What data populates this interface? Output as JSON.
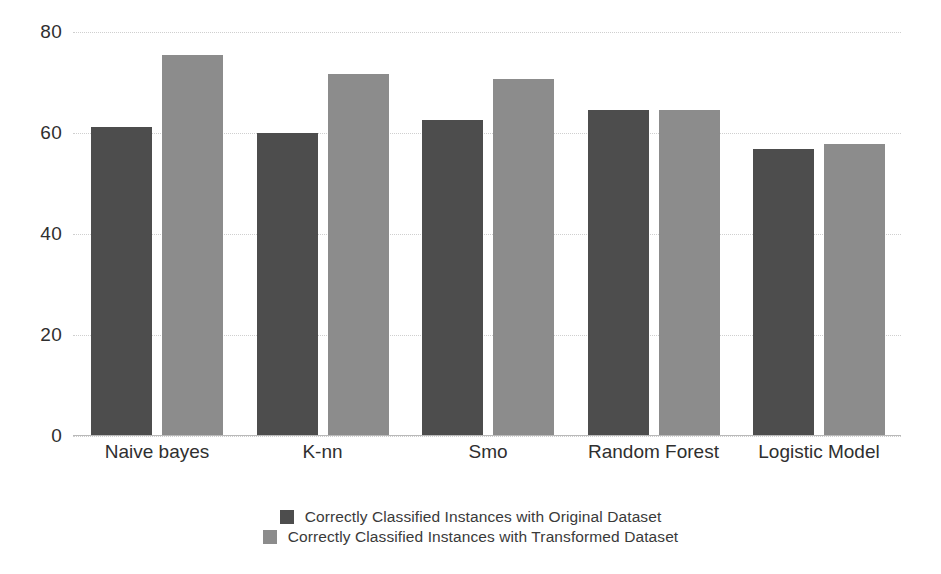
{
  "chart_data": {
    "type": "bar",
    "title": "",
    "xlabel": "",
    "ylabel": "",
    "ylim": [
      0,
      80
    ],
    "yticks": [
      0,
      20,
      40,
      60,
      80
    ],
    "grid": true,
    "legend_position": "bottom",
    "categories": [
      "Naive bayes",
      "K-nn",
      "Smo",
      "Random Forest",
      "Logistic Model"
    ],
    "series": [
      {
        "name": "Correctly Classified Instances with Original Dataset",
        "color": "#4d4d4d",
        "values": [
          61.2,
          60.1,
          62.6,
          64.6,
          56.9
        ]
      },
      {
        "name": "Correctly Classified Instances with Transformed Dataset",
        "color": "#8c8c8c",
        "values": [
          75.5,
          71.7,
          70.7,
          64.6,
          57.9
        ]
      }
    ]
  },
  "axis": {
    "y_tick_labels": [
      "80",
      "60",
      "40",
      "20",
      "0"
    ]
  },
  "colors": {
    "series_original": "#4d4d4d",
    "series_transformed": "#8c8c8c",
    "gridline": "#cfcfcf",
    "axis": "#b9b9b9",
    "text": "#2f2f2f",
    "background": "#ffffff"
  }
}
